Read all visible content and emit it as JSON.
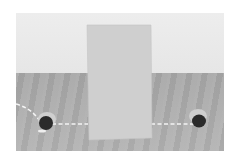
{
  "scene": {
    "description": "3D rendered grayscale scene: a standing rectangular panel on a wooden floor between two holes, with a dashed trajectory line passing behind the panel from the left hole to the right hole",
    "colors": {
      "wall": "#e8e8e8",
      "floor": "#acacac",
      "panel": "#cfcfcf",
      "hole": "#2a2a2a",
      "path": "#ffffff"
    },
    "objects": [
      "panel",
      "left-hole",
      "right-hole",
      "dashed-path"
    ]
  }
}
